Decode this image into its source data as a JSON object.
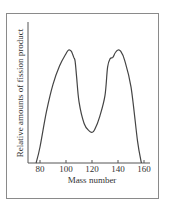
{
  "chart_data": {
    "type": "line",
    "title": "",
    "xlabel": "Mass number",
    "ylabel": "Relative amounts of fission product",
    "xlim": [
      72,
      162
    ],
    "xticks": [
      80,
      100,
      120,
      140,
      160
    ],
    "ylim": [
      0,
      1
    ],
    "grid": false,
    "legend": null,
    "series": [
      {
        "name": "fission product yield",
        "x": [
          77,
          80,
          85,
          90,
          95,
          100,
          102,
          104,
          106,
          107,
          108,
          110,
          114,
          118,
          120,
          122,
          126,
          130,
          132,
          134,
          136,
          138,
          140,
          142,
          145,
          150,
          155,
          158
        ],
        "y": [
          0.0,
          0.13,
          0.42,
          0.64,
          0.79,
          0.89,
          0.92,
          0.91,
          0.86,
          0.83,
          0.72,
          0.5,
          0.32,
          0.26,
          0.25,
          0.27,
          0.38,
          0.55,
          0.78,
          0.85,
          0.86,
          0.9,
          0.92,
          0.91,
          0.84,
          0.62,
          0.18,
          0.0
        ]
      }
    ]
  }
}
